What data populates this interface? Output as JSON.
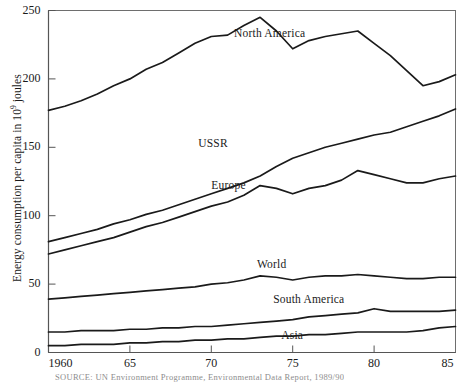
{
  "chart_data": {
    "type": "line",
    "title": "",
    "xlabel": "",
    "ylabel": "Energy consumption per capita in 10⁹ joules",
    "ylabel_prefix": "Energy consumption per capita in 10",
    "ylabel_exponent": "9",
    "ylabel_suffix": " joules",
    "xlim": [
      1960,
      1985
    ],
    "ylim": [
      0,
      250
    ],
    "grid": false,
    "legend_position": "inline-labels",
    "line_color": "#1a1a1a",
    "y_ticks": [
      0,
      50,
      100,
      150,
      200,
      250
    ],
    "y_tick_labels": [
      "0",
      "50",
      "100",
      "150",
      "200",
      "250"
    ],
    "x_ticks": [
      1960,
      1965,
      1970,
      1975,
      1980,
      1985
    ],
    "x_tick_labels": [
      "1960",
      "65",
      "70",
      "75",
      "80",
      "85"
    ],
    "x": [
      1960,
      1961,
      1962,
      1963,
      1964,
      1965,
      1966,
      1967,
      1968,
      1969,
      1970,
      1971,
      1972,
      1973,
      1974,
      1975,
      1976,
      1977,
      1978,
      1979,
      1980,
      1981,
      1982,
      1983,
      1984,
      1985
    ],
    "series": [
      {
        "name": "North America",
        "label": "North America",
        "label_x": 1971.4,
        "label_y": 232,
        "values": [
          177,
          180,
          184,
          189,
          195,
          200,
          207,
          212,
          219,
          226,
          231,
          232,
          239,
          245,
          235,
          222,
          228,
          231,
          233,
          235,
          226,
          217,
          206,
          195,
          198,
          203
        ]
      },
      {
        "name": "USSR",
        "label": "USSR",
        "label_x": 1969.2,
        "label_y": 152,
        "values": [
          81,
          84,
          87,
          90,
          94,
          97,
          101,
          104,
          108,
          112,
          116,
          120,
          124,
          129,
          136,
          142,
          146,
          150,
          153,
          156,
          159,
          161,
          165,
          169,
          173,
          178
        ]
      },
      {
        "name": "Europe",
        "label": "Europe",
        "label_x": 1970.0,
        "label_y": 121,
        "values": [
          72,
          75,
          78,
          81,
          84,
          88,
          92,
          95,
          99,
          103,
          107,
          110,
          115,
          122,
          120,
          116,
          120,
          122,
          126,
          133,
          130,
          127,
          124,
          124,
          127,
          129
        ]
      },
      {
        "name": "World",
        "label": "World",
        "label_x": 1972.8,
        "label_y": 63,
        "values": [
          39,
          40,
          41,
          42,
          43,
          44,
          45,
          46,
          47,
          48,
          50,
          51,
          53,
          56,
          55,
          53,
          55,
          56,
          56,
          57,
          56,
          55,
          54,
          54,
          55,
          55
        ]
      },
      {
        "name": "South America",
        "label": "South America",
        "label_x": 1973.8,
        "label_y": 38,
        "values": [
          15,
          15,
          16,
          16,
          16,
          17,
          17,
          18,
          18,
          19,
          19,
          20,
          21,
          22,
          23,
          24,
          26,
          27,
          28,
          29,
          32,
          30,
          30,
          30,
          30,
          31
        ]
      },
      {
        "name": "Asia",
        "label": "Asia",
        "label_x": 1974.3,
        "label_y": 11,
        "values": [
          5,
          5,
          6,
          6,
          6,
          7,
          7,
          8,
          8,
          9,
          9,
          10,
          10,
          11,
          12,
          12,
          13,
          13,
          14,
          15,
          15,
          15,
          15,
          16,
          18,
          19
        ]
      }
    ]
  },
  "source": {
    "text": "SOURCE:  UN Environment Programme, Environmental Data Report, 1989/90"
  }
}
